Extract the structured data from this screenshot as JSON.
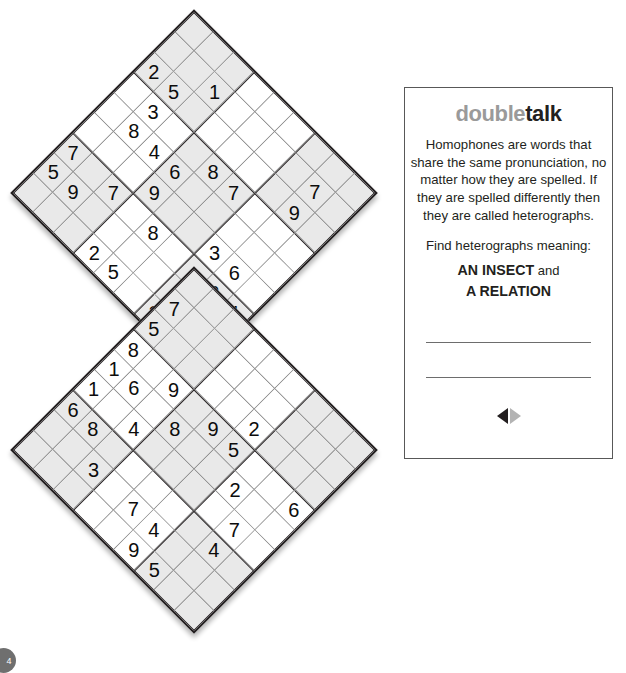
{
  "puzzle": {
    "kind": "sudoku-pair-diamond",
    "size": 9,
    "grids": [
      {
        "name": "top-grid",
        "clues": [
          {
            "r": 2,
            "c": 0,
            "v": "2"
          },
          {
            "r": 2,
            "c": 1,
            "v": "5"
          },
          {
            "r": 1,
            "c": 2,
            "v": "1"
          },
          {
            "r": 3,
            "c": 1,
            "v": "3"
          },
          {
            "r": 4,
            "c": 1,
            "v": "8"
          },
          {
            "r": 4,
            "c": 2,
            "v": "4"
          },
          {
            "r": 6,
            "c": 0,
            "v": "7"
          },
          {
            "r": 7,
            "c": 0,
            "v": "5"
          },
          {
            "r": 4,
            "c": 3,
            "v": "6"
          },
          {
            "r": 3,
            "c": 4,
            "v": "8"
          },
          {
            "r": 3,
            "c": 5,
            "v": "7"
          },
          {
            "r": 1,
            "c": 7,
            "v": "7"
          },
          {
            "r": 2,
            "c": 7,
            "v": "9"
          },
          {
            "r": 5,
            "c": 3,
            "v": "9"
          },
          {
            "r": 7,
            "c": 1,
            "v": "9"
          },
          {
            "r": 6,
            "c": 2,
            "v": "7"
          },
          {
            "r": 6,
            "c": 4,
            "v": "8"
          },
          {
            "r": 5,
            "c": 6,
            "v": "3"
          },
          {
            "r": 5,
            "c": 7,
            "v": "6"
          },
          {
            "r": 8,
            "c": 3,
            "v": "2"
          },
          {
            "r": 8,
            "c": 4,
            "v": "5"
          },
          {
            "r": 6,
            "c": 7,
            "v": "2"
          },
          {
            "r": 7,
            "c": 7,
            "v": "1"
          },
          {
            "r": 6,
            "c": 8,
            "v": "4"
          },
          {
            "r": 8,
            "c": 6,
            "v": "3"
          },
          {
            "r": 7,
            "c": 8,
            "v": "6"
          }
        ]
      },
      {
        "name": "bottom-grid",
        "clues": [
          {
            "r": 1,
            "c": 0,
            "v": "7"
          },
          {
            "r": 2,
            "c": 0,
            "v": "5"
          },
          {
            "r": 3,
            "c": 0,
            "v": "8"
          },
          {
            "r": 4,
            "c": 0,
            "v": "1"
          },
          {
            "r": 4,
            "c": 1,
            "v": "6"
          },
          {
            "r": 5,
            "c": 0,
            "v": "1"
          },
          {
            "r": 3,
            "c": 2,
            "v": "9"
          },
          {
            "r": 4,
            "c": 3,
            "v": "8"
          },
          {
            "r": 3,
            "c": 4,
            "v": "9"
          },
          {
            "r": 2,
            "c": 5,
            "v": "2"
          },
          {
            "r": 3,
            "c": 5,
            "v": "5"
          },
          {
            "r": 5,
            "c": 2,
            "v": "4"
          },
          {
            "r": 4,
            "c": 6,
            "v": "2"
          },
          {
            "r": 3,
            "c": 8,
            "v": "6"
          },
          {
            "r": 6,
            "c": 0,
            "v": "6"
          },
          {
            "r": 6,
            "c": 1,
            "v": "8"
          },
          {
            "r": 5,
            "c": 7,
            "v": "7"
          },
          {
            "r": 7,
            "c": 2,
            "v": "3"
          },
          {
            "r": 7,
            "c": 4,
            "v": "7"
          },
          {
            "r": 7,
            "c": 5,
            "v": "4"
          },
          {
            "r": 6,
            "c": 7,
            "v": "4"
          },
          {
            "r": 8,
            "c": 5,
            "v": "9"
          },
          {
            "r": 8,
            "c": 6,
            "v": "5"
          }
        ]
      }
    ]
  },
  "card": {
    "title_part1": "double",
    "title_part2": "talk",
    "description": "Homophones are words that share the same pronunciation, no matter how they are spelled. If they are spelled differently then they are called heterographs.",
    "find_label": "Find heterographs meaning:",
    "answer_line1_bold": "AN INSECT",
    "answer_line1_join": " and",
    "answer_line2_bold": "A RELATION",
    "arrow_left": "prev-arrow",
    "arrow_right": "next-arrow"
  },
  "page": {
    "number": "4"
  },
  "colors": {
    "shade": "#e9e9e9",
    "line_thin": "#8a8a8a",
    "line_thick": "#231f20",
    "title_gray": "#9a9a9a",
    "title_dark": "#231f20"
  }
}
